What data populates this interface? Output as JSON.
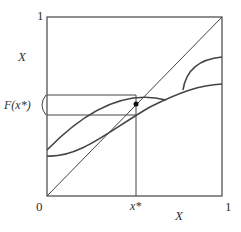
{
  "diagram": {
    "type": "fixed-point-map-diagram",
    "axes": {
      "x_label": "X",
      "y_label": "X",
      "x_min_label": "0",
      "x_max_label": "1",
      "y_max_label": "1",
      "x_star_label": "x*",
      "f_x_star_label": "F(x*)"
    },
    "elements": [
      {
        "kind": "box",
        "description": "unit square frame"
      },
      {
        "kind": "line",
        "description": "45-degree diagonal from (0,0) to (1,1)"
      },
      {
        "kind": "curve",
        "description": "concave arc rising from left edge, peaking near x*, descending to meet lower curve"
      },
      {
        "kind": "curve",
        "description": "convex-then-rising lower curve from left edge to right edge"
      },
      {
        "kind": "curve",
        "description": "branch rising from lower curve to right edge"
      },
      {
        "kind": "vertical-line",
        "description": "x = x*"
      },
      {
        "kind": "band",
        "description": "horizontal band marking F(x*) set between two curve values at x*"
      },
      {
        "kind": "point",
        "description": "fixed point on diagonal at x*"
      }
    ],
    "colors": {
      "stroke": "#444444",
      "text": "#333333",
      "background": "#ffffff"
    }
  }
}
